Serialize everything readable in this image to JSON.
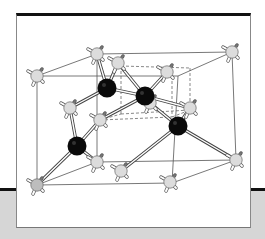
{
  "figure": {
    "colors": {
      "background": "#ffffff",
      "band": "#d6d6d6",
      "rule": "#111111",
      "cell_edge": "#555555",
      "bond_outline": "#444444",
      "bond_fill": "#ffffff",
      "atom_light": "#dcdcdc",
      "atom_light_dark_shade": "#bdbdbd",
      "atom_dark": "#0a0a0a"
    },
    "cell_edges": [
      [
        37,
        76,
        97,
        54
      ],
      [
        97,
        54,
        232,
        52
      ],
      [
        37,
        76,
        178,
        76
      ],
      [
        178,
        76,
        232,
        52
      ],
      [
        37,
        76,
        37,
        185
      ],
      [
        97,
        54,
        97,
        162
      ],
      [
        232,
        52,
        236,
        160
      ],
      [
        178,
        76,
        172,
        183
      ],
      [
        37,
        185,
        172,
        183
      ],
      [
        97,
        162,
        236,
        160
      ],
      [
        37,
        185,
        97,
        162
      ],
      [
        172,
        183,
        236,
        160
      ]
    ],
    "inner_cell_dashed": [
      [
        121,
        66,
        190,
        68
      ],
      [
        190,
        68,
        190,
        110
      ],
      [
        121,
        66,
        121,
        114
      ],
      [
        121,
        114,
        190,
        110
      ],
      [
        100,
        120,
        172,
        117
      ],
      [
        172,
        117,
        190,
        110
      ],
      [
        100,
        120,
        121,
        114
      ],
      [
        172,
        76,
        172,
        117
      ]
    ],
    "bonds": [
      [
        107,
        88,
        97,
        54
      ],
      [
        107,
        88,
        118,
        63
      ],
      [
        107,
        88,
        70,
        108
      ],
      [
        107,
        88,
        145,
        96
      ],
      [
        145,
        96,
        118,
        63
      ],
      [
        145,
        96,
        167,
        72
      ],
      [
        145,
        96,
        100,
        120
      ],
      [
        145,
        96,
        190,
        108
      ],
      [
        178,
        126,
        150,
        103
      ],
      [
        178,
        126,
        190,
        108
      ],
      [
        178,
        126,
        236,
        160
      ],
      [
        178,
        126,
        121,
        171
      ],
      [
        77,
        146,
        70,
        108
      ],
      [
        77,
        146,
        100,
        120
      ],
      [
        77,
        146,
        37,
        185
      ],
      [
        77,
        146,
        97,
        162
      ]
    ],
    "atoms_light": [
      {
        "x": 97,
        "y": 54,
        "shade": "light"
      },
      {
        "x": 232,
        "y": 52,
        "shade": "light"
      },
      {
        "x": 37,
        "y": 76,
        "shade": "light"
      },
      {
        "x": 118,
        "y": 63,
        "shade": "light"
      },
      {
        "x": 167,
        "y": 72,
        "shade": "light"
      },
      {
        "x": 70,
        "y": 108,
        "shade": "light"
      },
      {
        "x": 100,
        "y": 120,
        "shade": "light"
      },
      {
        "x": 150,
        "y": 103,
        "shade": "light"
      },
      {
        "x": 190,
        "y": 108,
        "shade": "light"
      },
      {
        "x": 97,
        "y": 162,
        "shade": "light"
      },
      {
        "x": 121,
        "y": 171,
        "shade": "light"
      },
      {
        "x": 236,
        "y": 160,
        "shade": "light"
      },
      {
        "x": 37,
        "y": 185,
        "shade": "dark"
      },
      {
        "x": 170,
        "y": 182,
        "shade": "light"
      }
    ],
    "atoms_dark": [
      {
        "x": 107,
        "y": 88
      },
      {
        "x": 145,
        "y": 96
      },
      {
        "x": 178,
        "y": 126
      },
      {
        "x": 77,
        "y": 146
      }
    ]
  }
}
